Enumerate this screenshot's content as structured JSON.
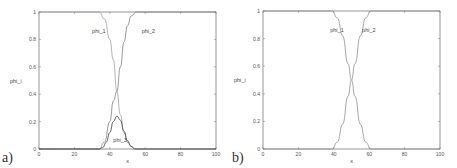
{
  "chart_data": [
    {
      "type": "line",
      "panel_label": "a)",
      "xlabel": "x",
      "ylabel": "phi_i",
      "xlim": [
        0,
        100
      ],
      "ylim": [
        0,
        1
      ],
      "xticks": [
        "0",
        "20",
        "40",
        "60",
        "80",
        "100"
      ],
      "yticks": [
        "0",
        "0.2",
        "0.4",
        "0.6",
        "0.8",
        "1"
      ],
      "grid": false,
      "series": [
        {
          "name": "phi_1",
          "label_pos": [
            30,
            0.85
          ],
          "color": "#a0a0a0",
          "x": [
            0,
            34,
            37,
            40,
            42,
            44,
            46,
            48,
            50,
            52,
            55,
            100
          ],
          "y": [
            1,
            1,
            0.95,
            0.8,
            0.65,
            0.42,
            0.25,
            0.12,
            0.05,
            0.02,
            0,
            0
          ]
        },
        {
          "name": "phi_2",
          "label_pos": [
            58,
            0.85
          ],
          "color": "#808080",
          "x": [
            0,
            34,
            37,
            40,
            42,
            44,
            46,
            48,
            50,
            52,
            55,
            100
          ],
          "y": [
            0,
            0,
            0.05,
            0.2,
            0.35,
            0.42,
            0.6,
            0.78,
            0.9,
            0.97,
            1,
            1
          ]
        },
        {
          "name": "phi_3",
          "label_pos": [
            42,
            0.05
          ],
          "color": "#404040",
          "x": [
            0,
            34,
            36,
            38,
            40,
            42,
            44,
            46,
            48,
            50,
            52,
            54,
            100
          ],
          "y": [
            0,
            0,
            0.01,
            0.05,
            0.12,
            0.2,
            0.24,
            0.21,
            0.13,
            0.06,
            0.02,
            0,
            0
          ]
        }
      ]
    },
    {
      "type": "line",
      "panel_label": "b)",
      "xlabel": "x",
      "ylabel": "phi_i",
      "xlim": [
        0,
        100
      ],
      "ylim": [
        0,
        1
      ],
      "xticks": [
        "0",
        "20",
        "40",
        "60",
        "80",
        "100"
      ],
      "yticks": [
        "0",
        "0.2",
        "0.4",
        "0.6",
        "0.8",
        "1"
      ],
      "grid": false,
      "series": [
        {
          "name": "phi_1",
          "label_pos": [
            38,
            0.85
          ],
          "color": "#909090",
          "x": [
            0,
            39,
            42,
            45,
            48,
            50,
            52,
            55,
            58,
            61,
            100
          ],
          "y": [
            1,
            1,
            0.95,
            0.82,
            0.62,
            0.5,
            0.38,
            0.18,
            0.05,
            0,
            0
          ]
        },
        {
          "name": "phi_2",
          "label_pos": [
            56,
            0.85
          ],
          "color": "#909090",
          "x": [
            0,
            39,
            42,
            45,
            48,
            50,
            52,
            55,
            58,
            61,
            100
          ],
          "y": [
            0,
            0,
            0.05,
            0.18,
            0.38,
            0.5,
            0.62,
            0.82,
            0.95,
            1,
            1
          ]
        }
      ]
    }
  ]
}
